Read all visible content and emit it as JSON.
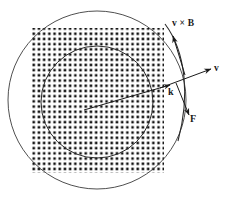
{
  "figure": {
    "background_color": "#ffffff",
    "stroke_color": "#1a1a1a",
    "dot_color": "#111111",
    "labels": {
      "v_cross_b": "v × B",
      "v": "v",
      "k": "k",
      "f": "F"
    },
    "field_region": {
      "name": "magnetic-field-dot-grid",
      "symbol": "dot",
      "meaning": "B out of page",
      "grid_spacing_px": 5.2,
      "dot_radius_px": 1.25,
      "left_px": 32,
      "top_px": 28,
      "right_px": 164,
      "bottom_px": 173
    },
    "outer_circle": {
      "name": "outer-circle",
      "center_x": 97,
      "center_y": 100,
      "radius": 89
    },
    "inner_circle": {
      "name": "inner-circle",
      "center_x": 97,
      "center_y": 102,
      "radius": 56
    },
    "radius_arrow": {
      "name": "radius-vector-k",
      "from_x": 84,
      "from_y": 110,
      "to_x": 170,
      "to_y": 85
    },
    "velocity_arrow": {
      "name": "velocity-vector-v",
      "from_x": 160,
      "from_y": 88,
      "to_x": 212,
      "to_y": 69
    },
    "vxb_arrow": {
      "name": "v-cross-b-vector",
      "from_x": 184,
      "from_y": 74,
      "to_x": 173,
      "to_y": 35
    },
    "force_arrow": {
      "name": "force-vector-f",
      "from_x": 176,
      "from_y": 83,
      "to_x": 190,
      "to_y": 116
    },
    "tangent_arc": {
      "name": "trajectory-arc",
      "start_x": 165,
      "start_y": 24,
      "end_x": 178,
      "end_y": 140
    }
  }
}
